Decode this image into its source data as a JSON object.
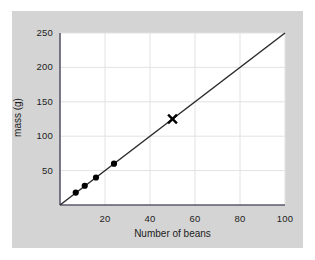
{
  "chart_data": {
    "type": "scatter",
    "title": "",
    "xlabel": "Number of beans",
    "ylabel": "mass (g)",
    "xlim": [
      0,
      100
    ],
    "ylim": [
      0,
      250
    ],
    "xticks": [
      20,
      40,
      60,
      80,
      100
    ],
    "yticks": [
      50,
      100,
      150,
      200,
      250
    ],
    "xtick_labels": [
      "20",
      "40",
      "60",
      "80",
      "100"
    ],
    "ytick_labels": [
      "50",
      "100",
      "150",
      "200",
      "250"
    ],
    "grid": true,
    "legend": "none",
    "series": [
      {
        "name": "measured data",
        "marker": "filled-circle",
        "color": "#000000",
        "x": [
          7,
          11,
          16,
          24
        ],
        "y": [
          18,
          28,
          40,
          60
        ]
      },
      {
        "name": "best fit line",
        "marker": "none",
        "color": "#2b2b2b",
        "x": [
          0,
          100
        ],
        "y": [
          0,
          250
        ]
      },
      {
        "name": "predicted point",
        "marker": "x-cross",
        "color": "#000000",
        "x": [
          50
        ],
        "y": [
          125
        ]
      }
    ]
  },
  "figure": {
    "panel_color": "#d4d4d4",
    "plot_background": "#ffffff",
    "grid_color": "#e2e2e2",
    "axis_color": "#5a5a6e",
    "line_color": "#2b2b2b",
    "marker_color": "#000000"
  }
}
